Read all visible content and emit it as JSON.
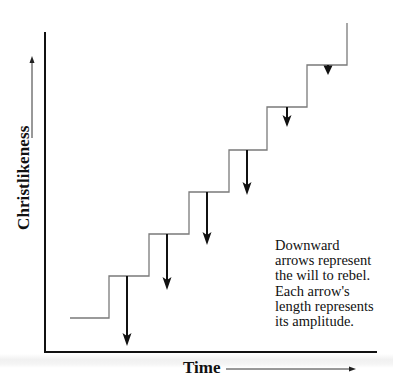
{
  "diagram": {
    "y_axis_label": "Christlikeness",
    "x_axis_label": "Time",
    "note_lines": [
      "Downward",
      "arrows represent",
      "the will to rebel.",
      "Each arrow's",
      "length represents",
      "its amplitude."
    ],
    "colors": {
      "axis": "#111111",
      "staircase": "#7a7a7a",
      "arrows": "#111111"
    },
    "staircase_steps": 6,
    "arrows": [
      {
        "step": 1,
        "relative_length": 69
      },
      {
        "step": 2,
        "relative_length": 55
      },
      {
        "step": 3,
        "relative_length": 52
      },
      {
        "step": 4,
        "relative_length": 44
      },
      {
        "step": 5,
        "relative_length": 20
      },
      {
        "step": 6,
        "relative_length": 10
      }
    ]
  }
}
